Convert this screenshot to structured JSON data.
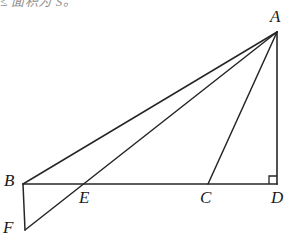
{
  "figure": {
    "name": "geometry-figure-triangle-abd",
    "background_color": "#ffffff",
    "stroke_color": "#262626",
    "stroke_width": 1.4,
    "width": 299,
    "height": 245
  },
  "clipped_header": {
    "text": "≤ 面积为 S。"
  },
  "points": {
    "A": {
      "label": "A",
      "x": 277,
      "y": 32,
      "label_x": 270,
      "label_y": 8
    },
    "B": {
      "label": "B",
      "x": 23,
      "y": 184,
      "label_x": 4,
      "label_y": 172
    },
    "C": {
      "label": "C",
      "x": 208,
      "y": 184,
      "label_x": 200,
      "label_y": 189
    },
    "D": {
      "label": "D",
      "x": 277,
      "y": 184,
      "label_x": 271,
      "label_y": 189
    },
    "E": {
      "label": "E",
      "x": 82,
      "y": 184,
      "label_x": 79,
      "label_y": 189
    },
    "F": {
      "label": "F",
      "x": 25,
      "y": 230,
      "label_x": 3,
      "label_y": 219
    }
  },
  "segments": [
    {
      "name": "segment-BD",
      "from": "B",
      "to": "D"
    },
    {
      "name": "segment-AD",
      "from": "A",
      "to": "D"
    },
    {
      "name": "segment-AB",
      "from": "A",
      "to": "B"
    },
    {
      "name": "segment-AC",
      "from": "A",
      "to": "C"
    },
    {
      "name": "segment-AF",
      "from": "A",
      "to": "F"
    },
    {
      "name": "segment-BF",
      "from": "B",
      "to": "F"
    }
  ],
  "right_angle_marker": {
    "name": "right-angle-marker-D",
    "at_vertex": "D",
    "size": 8,
    "description": "square mark indicating angle ADB = 90 degrees"
  }
}
